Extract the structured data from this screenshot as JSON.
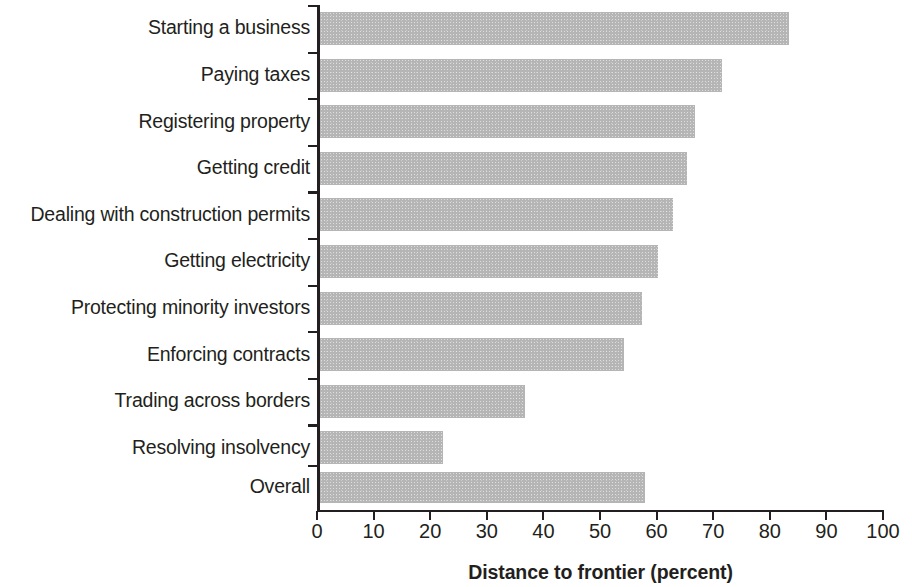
{
  "chart_data": {
    "type": "bar",
    "orientation": "horizontal",
    "title": "",
    "subtitle": "",
    "xlabel": "Distance to frontier (percent)",
    "ylabel": "",
    "xlim": [
      0,
      100
    ],
    "xticks": [
      "0",
      "10",
      "20",
      "30",
      "40",
      "50",
      "60",
      "70",
      "80",
      "90",
      "100"
    ],
    "grid": false,
    "legend": null,
    "bar_color": "#b5b5b5",
    "axis_color": "#231f20",
    "categories": [
      "Starting a business",
      "Paying taxes",
      "Registering property",
      "Getting credit",
      "Dealing with construction permits",
      "Getting electricity",
      "Protecting minority investors",
      "Enforcing contracts",
      "Trading across borders",
      "Resolving insolvency",
      "Overall"
    ],
    "values": [
      83.4,
      71.5,
      66.8,
      65.4,
      62.9,
      60.2,
      57.5,
      54.3,
      36.7,
      22.2,
      58.0
    ]
  }
}
